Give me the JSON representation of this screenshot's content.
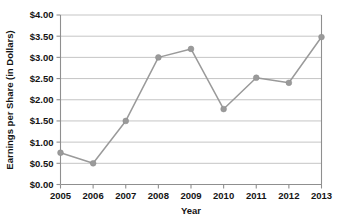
{
  "chart_data": {
    "type": "line",
    "title": "",
    "xlabel": "Year",
    "ylabel": "Earnings per Share (in Dollars)",
    "categories": [
      "2005",
      "2006",
      "2007",
      "2008",
      "2009",
      "2010",
      "2011",
      "2012",
      "2013"
    ],
    "values": [
      0.75,
      0.5,
      1.5,
      3.0,
      3.2,
      1.78,
      2.52,
      2.4,
      3.48
    ],
    "series": [
      {
        "name": "Earnings per Share",
        "values": [
          0.75,
          0.5,
          1.5,
          3.0,
          3.2,
          1.78,
          2.52,
          2.4,
          3.48
        ]
      }
    ],
    "ylim": [
      0,
      4.0
    ],
    "ytick_step": 0.5,
    "ytick_labels": [
      "$0.00",
      "$0.50",
      "$1.00",
      "$1.50",
      "$2.00",
      "$2.50",
      "$3.00",
      "$3.50",
      "$4.00"
    ],
    "ytick_values": [
      0,
      0.5,
      1.0,
      1.5,
      2.0,
      2.5,
      3.0,
      3.5,
      4.0
    ],
    "xtick_labels": [
      "2005",
      "2006",
      "2007",
      "2008",
      "2009",
      "2010",
      "2011",
      "2012",
      "2013"
    ],
    "grid": true,
    "grid_axis": "y",
    "legend": false,
    "legend_position": "none",
    "marker": "circle",
    "colors": {
      "line": "#9a9a9a",
      "marker": "#9a9a9a",
      "grid": "#b6b6b6",
      "axis": "#8f8f8f",
      "text": "#141414",
      "background": "#ffffff"
    }
  }
}
